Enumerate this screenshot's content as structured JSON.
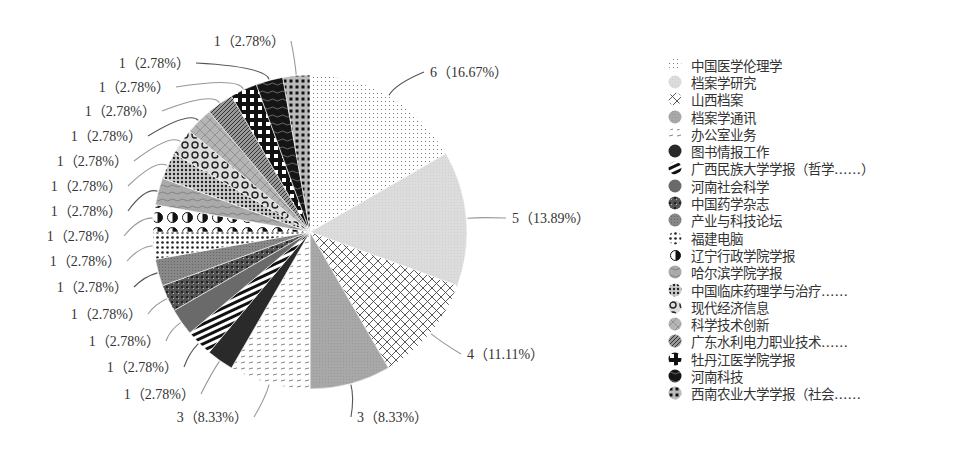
{
  "chart_data": {
    "type": "pie",
    "title": "",
    "total": 36,
    "start_angle_deg": 0,
    "direction": "clockwise",
    "legend_position": "right",
    "slices": [
      {
        "name": "中国医学伦理学",
        "value": 6,
        "percent": "16.67%",
        "label": "6（16.67%）",
        "pattern": "fine-dots"
      },
      {
        "name": "档案学研究",
        "value": 5,
        "percent": "13.89%",
        "label": "5（13.89%）",
        "pattern": "light-gray"
      },
      {
        "name": "山西档案",
        "value": 4,
        "percent": "11.11%",
        "label": "4（11.11%）",
        "pattern": "cross-hatch"
      },
      {
        "name": "档案学通讯",
        "value": 3,
        "percent": "8.33%",
        "label": "3（8.33%）",
        "pattern": "mid-gray"
      },
      {
        "name": "办公室业务",
        "value": 3,
        "percent": "8.33%",
        "label": "3（8.33%）",
        "pattern": "dashes"
      },
      {
        "name": "图书情报工作",
        "value": 1,
        "percent": "2.78%",
        "label": "1（2.78%）",
        "pattern": "black"
      },
      {
        "name": "广西民族大学学报（哲学……）",
        "value": 1,
        "percent": "2.78%",
        "label": "1（2.78%）",
        "pattern": "horizontal-stripes"
      },
      {
        "name": "河南社会科学",
        "value": 1,
        "percent": "2.78%",
        "label": "1（2.78%）",
        "pattern": "dark-gray"
      },
      {
        "name": "中国药学杂志",
        "value": 1,
        "percent": "2.78%",
        "label": "1（2.78%）",
        "pattern": "checker-dots"
      },
      {
        "name": "产业与科技论坛",
        "value": 1,
        "percent": "2.78%",
        "label": "1（2.78%）",
        "pattern": "gray-fine"
      },
      {
        "name": "福建电脑",
        "value": 1,
        "percent": "2.78%",
        "label": "1（2.78%）",
        "pattern": "dot-rows"
      },
      {
        "name": "辽宁行政学院学报",
        "value": 1,
        "percent": "2.78%",
        "label": "1（2.78%）",
        "pattern": "half-circles"
      },
      {
        "name": "哈尔滨学院学报",
        "value": 1,
        "percent": "2.78%",
        "label": "1（2.78%）",
        "pattern": "wavy-gray"
      },
      {
        "name": "中国临床药理学与治疗……",
        "value": 1,
        "percent": "2.78%",
        "label": "1（2.78%）",
        "pattern": "dense-dots"
      },
      {
        "name": "现代经济信息",
        "value": 1,
        "percent": "2.78%",
        "label": "1（2.78%）",
        "pattern": "rings"
      },
      {
        "name": "科学技术创新",
        "value": 1,
        "percent": "2.78%",
        "label": "1（2.78%）",
        "pattern": "gray-cross"
      },
      {
        "name": "广东水利电力职业技术……",
        "value": 1,
        "percent": "2.78%",
        "label": "1（2.78%）",
        "pattern": "diagonal"
      },
      {
        "name": "牡丹江医学院学报",
        "value": 1,
        "percent": "2.78%",
        "label": "1（2.78%）",
        "pattern": "big-checks"
      },
      {
        "name": "河南科技",
        "value": 1,
        "percent": "2.78%",
        "label": "1（2.78%）",
        "pattern": "black-wavy"
      },
      {
        "name": "西南农业大学学报（社会……",
        "value": 1,
        "percent": "2.78%",
        "label": "1（2.78%）",
        "pattern": "grid-dots"
      }
    ]
  },
  "legend": {
    "items": [
      "中国医学伦理学",
      "档案学研究",
      "山西档案",
      "档案学通讯",
      "办公室业务",
      "图书情报工作",
      "广西民族大学学报（哲学……）",
      "河南社会科学",
      "中国药学杂志",
      "产业与科技论坛",
      "福建电脑",
      "辽宁行政学院学报",
      "哈尔滨学院学报",
      "中国临床药理学与治疗……",
      "现代经济信息",
      "科学技术创新",
      "广东水利电力职业技术……",
      "牡丹江医学院学报",
      "河南科技",
      "西南农业大学学报（社会……"
    ]
  }
}
